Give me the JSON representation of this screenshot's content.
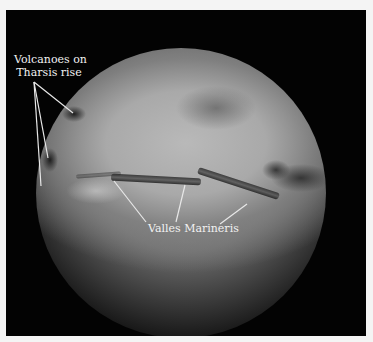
{
  "image": {
    "subject": "Mars globe",
    "background_color": "#030303",
    "border_color": "#f4f4f4"
  },
  "annotations": {
    "tharsis": {
      "line1": "Volcanoes on",
      "line2": "Tharsis rise"
    },
    "valles": {
      "text": "Valles Marineris"
    }
  }
}
